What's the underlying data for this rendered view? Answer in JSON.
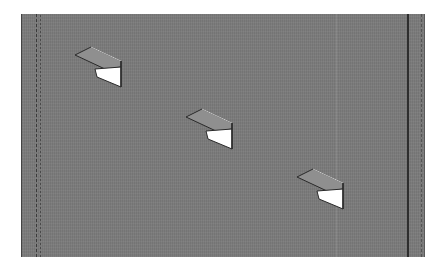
{
  "scene": {
    "description": "3D render of three wall-mounted shelf brackets on a gray wall panel",
    "colors": {
      "wall": "#7b7b7b",
      "bracket_top": "#8e8e8e",
      "bracket_side": "#ffffff",
      "edge": "#2a2a2a"
    },
    "brackets": [
      {
        "x": 73,
        "y": 45
      },
      {
        "x": 184,
        "y": 107
      },
      {
        "x": 295,
        "y": 167
      }
    ]
  }
}
